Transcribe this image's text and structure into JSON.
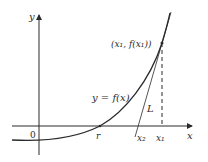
{
  "figure": {
    "type": "newton-method-diagram",
    "labels": {
      "y_axis": "y",
      "x_axis": "x",
      "origin": "0",
      "root": "r",
      "curve": "y = f(x)",
      "point": "(x₁, f(x₁))",
      "tangent": "L",
      "x1": "x₁",
      "x2": "x₂"
    },
    "colors": {
      "ink": "#2a2a2a",
      "background": "#ffffff"
    }
  }
}
